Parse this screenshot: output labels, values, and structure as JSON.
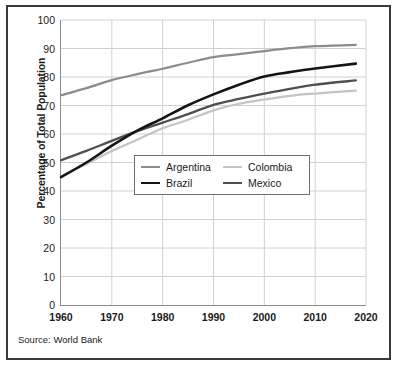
{
  "chart_data": {
    "type": "line",
    "title": "",
    "xlabel": "",
    "ylabel": "Percentage of Total Population",
    "xlim": [
      1960,
      2020
    ],
    "ylim": [
      0,
      100
    ],
    "grid": true,
    "legend_position": "inside-center",
    "source": "Source: World Bank",
    "x_ticks": [
      1960,
      1970,
      1980,
      1990,
      2000,
      2010,
      2020
    ],
    "y_ticks": [
      0,
      10,
      20,
      30,
      40,
      50,
      60,
      70,
      80,
      90,
      100
    ],
    "series": [
      {
        "name": "Argentina",
        "color": "#8c8c8c",
        "width": 2.2,
        "x": [
          1960,
          1965,
          1970,
          1975,
          1980,
          1985,
          1990,
          1995,
          2000,
          2005,
          2010,
          2018
        ],
        "values": [
          73.6,
          76.1,
          78.9,
          81.0,
          82.9,
          85.0,
          87.0,
          88.0,
          89.1,
          90.1,
          90.8,
          91.3
        ]
      },
      {
        "name": "Colombia",
        "color": "#c4c4c4",
        "width": 2.2,
        "x": [
          1960,
          1965,
          1970,
          1975,
          1980,
          1985,
          1990,
          1995,
          2000,
          2005,
          2010,
          2018
        ],
        "values": [
          45.0,
          49.5,
          54.0,
          58.0,
          62.0,
          65.0,
          68.3,
          70.6,
          72.1,
          73.4,
          74.2,
          75.2
        ]
      },
      {
        "name": "Brazil",
        "color": "#141414",
        "width": 2.6,
        "x": [
          1960,
          1965,
          1970,
          1975,
          1980,
          1985,
          1990,
          1995,
          2000,
          2005,
          2010,
          2018
        ],
        "values": [
          44.9,
          50.0,
          55.9,
          61.2,
          65.5,
          70.1,
          73.9,
          77.3,
          80.2,
          81.7,
          83.0,
          84.7
        ]
      },
      {
        "name": "Mexico",
        "color": "#4f4f4f",
        "width": 2.3,
        "x": [
          1960,
          1965,
          1970,
          1975,
          1980,
          1985,
          1990,
          1995,
          2000,
          2005,
          2010,
          2018
        ],
        "values": [
          50.8,
          54.1,
          57.6,
          61.0,
          64.0,
          67.0,
          70.2,
          72.3,
          74.2,
          75.8,
          77.3,
          78.8
        ]
      }
    ]
  }
}
